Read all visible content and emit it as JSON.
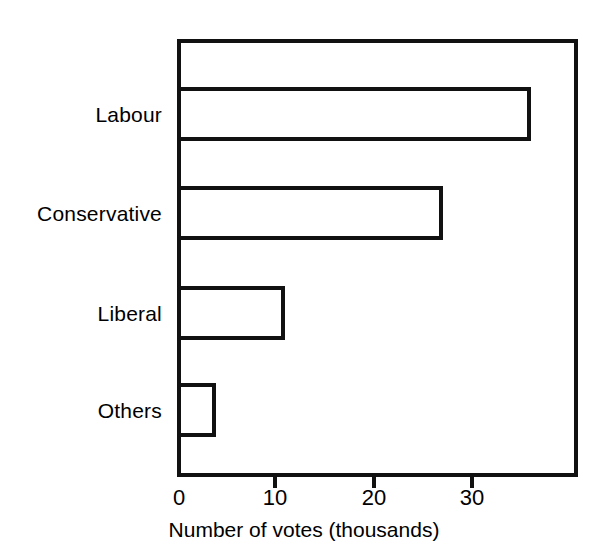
{
  "chart_data": {
    "type": "bar",
    "orientation": "horizontal",
    "title": "",
    "subtitle": "",
    "categories": [
      "Labour",
      "Conservative",
      "Liberal",
      "Others"
    ],
    "values": [
      36,
      27,
      11,
      4
    ],
    "series": [
      {
        "name": "Number of votes (thousands)",
        "values": [
          36,
          27,
          11,
          4
        ]
      }
    ],
    "xlabel": "Number of votes (thousands)",
    "ylabel": "",
    "xlim": [
      0,
      40.7
    ],
    "xticks": [
      0,
      10,
      20,
      30
    ],
    "xtick_labels": [
      "0",
      "10",
      "20",
      "30"
    ],
    "grid": false,
    "legend": false,
    "legend_position": "none",
    "bar_style": "outlined",
    "bar_fill_color": "#ffffff",
    "bar_edge_color": "#111111",
    "axis_color": "#111111",
    "background_color": "#ffffff",
    "annotations": []
  },
  "axis": {
    "title": "Number of votes (thousands)"
  }
}
